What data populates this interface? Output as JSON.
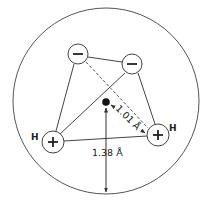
{
  "diagram": {
    "charges": [
      {
        "id": "neg1",
        "symbol": "−",
        "type": "negative"
      },
      {
        "id": "neg2",
        "symbol": "−",
        "type": "negative"
      },
      {
        "id": "pos_left",
        "symbol": "+",
        "type": "positive",
        "label": "H"
      },
      {
        "id": "pos_right",
        "symbol": "+",
        "type": "positive",
        "label": "H"
      }
    ],
    "labels": {
      "h_left": "H",
      "h_right": "H",
      "distance_center_to_h": "1.01 Å",
      "radius": "1.38 Å"
    },
    "colors": {
      "stroke": "#444444",
      "fill": "#ffffff",
      "nucleus": "#111111"
    }
  }
}
